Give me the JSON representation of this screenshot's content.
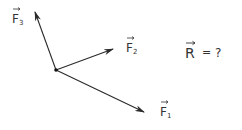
{
  "diagram": {
    "type": "vector-forces",
    "origin": {
      "x": 56,
      "y": 70
    },
    "vectors": [
      {
        "name": "F1",
        "label": "F",
        "subscript": "1",
        "tip": {
          "x": 144,
          "y": 112
        },
        "label_pos": {
          "x": 160,
          "y": 116
        }
      },
      {
        "name": "F2",
        "label": "F",
        "subscript": "2",
        "tip": {
          "x": 113,
          "y": 49
        },
        "label_pos": {
          "x": 126,
          "y": 52
        }
      },
      {
        "name": "F3",
        "label": "F",
        "subscript": "3",
        "tip": {
          "x": 35,
          "y": 12
        },
        "label_pos": {
          "x": 12,
          "y": 23
        }
      }
    ],
    "question": {
      "symbol": "R",
      "equals": "=",
      "value": "?"
    },
    "stroke_color": "#2a2a2a"
  }
}
